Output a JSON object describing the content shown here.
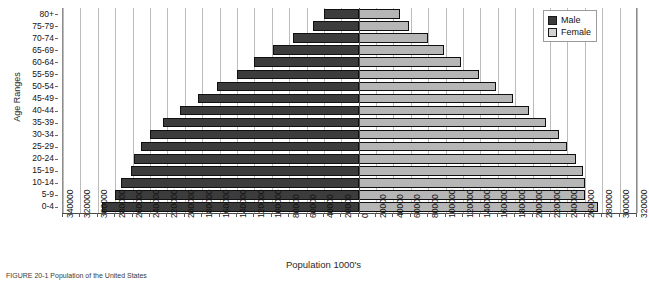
{
  "chart_data": {
    "type": "bar",
    "subtype": "population-pyramid",
    "title": "",
    "xlabel": "Population 1000's",
    "ylabel": "Age Ranges",
    "orientation": "horizontal",
    "grid": true,
    "legend_position": "top-right",
    "axis_min": -340000,
    "axis_max": 320000,
    "tick_step": 20000,
    "categories": [
      "0-4",
      "5-9",
      "10-14",
      "15-19",
      "20-24",
      "25-29",
      "30-34",
      "35-39",
      "40-44",
      "45-49",
      "50-54",
      "55-59",
      "60-64",
      "65-69",
      "70-74",
      "75-79",
      "80+"
    ],
    "left_tick_labels": [
      "340000",
      "320000",
      "300000",
      "280000",
      "260000",
      "240000",
      "220000",
      "200000",
      "180000",
      "160000",
      "140000",
      "120000",
      "100000",
      "80000",
      "60000",
      "40000",
      "20000"
    ],
    "right_tick_labels": [
      "0",
      "20000",
      "40000",
      "60000",
      "80000",
      "100000",
      "120000",
      "140000",
      "160000",
      "180000",
      "200000",
      "220000",
      "240000",
      "260000",
      "280000",
      "300000",
      "320000"
    ],
    "series": [
      {
        "name": "Male",
        "color": "#3c3c3c",
        "side": "left",
        "values": [
          295000,
          280000,
          273000,
          262000,
          258000,
          250000,
          240000,
          225000,
          205000,
          185000,
          163000,
          140000,
          120000,
          98000,
          76000,
          52000,
          40000
        ]
      },
      {
        "name": "Female",
        "color": "#b6b6b6",
        "side": "right",
        "values": [
          275000,
          260000,
          260000,
          258000,
          250000,
          240000,
          230000,
          215000,
          196000,
          178000,
          158000,
          138000,
          118000,
          98000,
          80000,
          58000,
          48000
        ]
      }
    ]
  },
  "legend": {
    "items": [
      {
        "label": "Male",
        "swatch": "male"
      },
      {
        "label": "Female",
        "swatch": "female"
      }
    ]
  },
  "axes": {
    "x_title": "Population 1000's",
    "y_title": "Age Ranges"
  },
  "caption": {
    "text": "FIGURE 20-1  Population of the United States"
  }
}
